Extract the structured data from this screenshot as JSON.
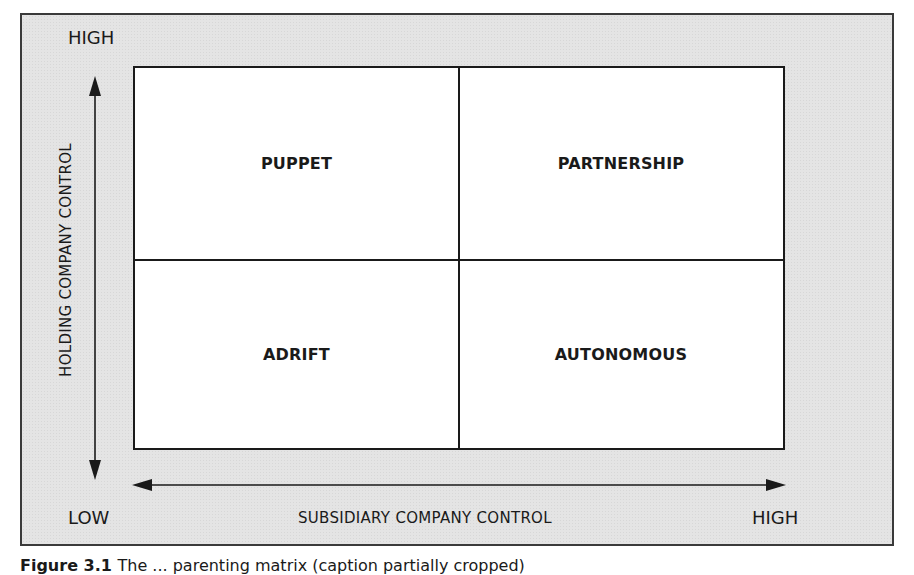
{
  "diagram": {
    "type": "2x2 matrix",
    "y_axis": {
      "title": "HOLDING COMPANY CONTROL",
      "high_label": "HIGH",
      "low_label": "LOW"
    },
    "x_axis": {
      "title": "SUBSIDIARY COMPANY CONTROL",
      "low_label": "LOW",
      "high_label": "HIGH"
    },
    "quadrants": {
      "top_left": "PUPPET",
      "top_right": "PARTNERSHIP",
      "bottom_left": "ADRIFT",
      "bottom_right": "AUTONOMOUS"
    },
    "colors": {
      "panel_bg": "#e4e4e4",
      "grid_bg": "#ffffff",
      "lines": "#1a1a1a"
    }
  },
  "caption": {
    "label": "Figure 3.1",
    "text": "The ... parenting matrix (caption partially cropped)"
  }
}
